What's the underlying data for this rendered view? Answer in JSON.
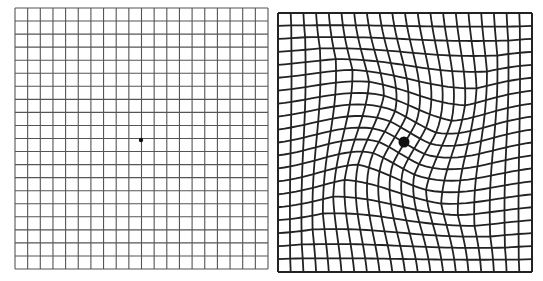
{
  "figure": {
    "panels": [
      {
        "name": "normal-amsler-grid",
        "cells": 20,
        "x": 15,
        "y": 8,
        "w": 253,
        "h": 261,
        "line_color": "#555555",
        "dot": {
          "cx": 141,
          "cy": 140,
          "r": 2.2
        }
      },
      {
        "name": "distorted-amsler-grid",
        "cells": 20,
        "x": 278,
        "y": 13,
        "w": 254,
        "h": 259,
        "line_color": "#222222",
        "dot": {
          "cx": 404,
          "cy": 142,
          "r": 5.5
        }
      }
    ],
    "colors": {
      "background": "#ffffff",
      "dot": "#111111"
    }
  }
}
